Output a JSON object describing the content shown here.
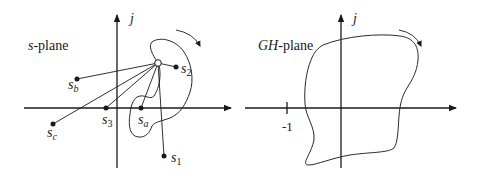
{
  "diagram": {
    "left_panel": {
      "plane_label_var": "s",
      "plane_label_suffix": "-plane",
      "imag_axis_label": "j",
      "test_point": "open circle on contour",
      "points": [
        {
          "id": "s1",
          "base": "s",
          "sub": "1"
        },
        {
          "id": "s2",
          "base": "s",
          "sub": "2"
        },
        {
          "id": "s3",
          "base": "s",
          "sub": "3"
        },
        {
          "id": "sa",
          "base": "s",
          "sub": "a"
        },
        {
          "id": "sb",
          "base": "s",
          "sub": "b"
        },
        {
          "id": "sc",
          "base": "s",
          "sub": "c"
        }
      ],
      "direction": "clockwise"
    },
    "right_panel": {
      "plane_label_var": "GH",
      "plane_label_suffix": "-plane",
      "imag_axis_label": "j",
      "tick_label": "-1",
      "direction": "clockwise"
    },
    "colors": {
      "ink": "#1a1a1a",
      "background": "#ffffff"
    }
  }
}
